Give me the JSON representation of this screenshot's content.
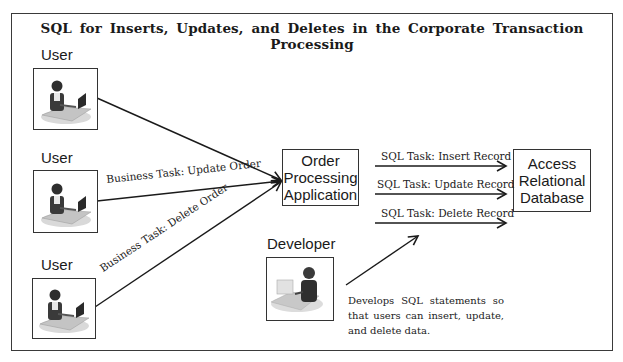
{
  "title": "SQL for Inserts, Updates, and Deletes in the Corporate Transaction Processing",
  "actors": [
    {
      "id": "user-1",
      "label": "User",
      "icon": "user-at-computer-icon"
    },
    {
      "id": "user-2",
      "label": "User",
      "icon": "user-at-computer-icon"
    },
    {
      "id": "user-3",
      "label": "User",
      "icon": "user-at-computer-icon"
    },
    {
      "id": "developer",
      "label": "Developer",
      "icon": "developer-at-computer-icon"
    }
  ],
  "nodes": {
    "app": {
      "lines": [
        "Order",
        "Processing",
        "Application"
      ]
    },
    "db": {
      "lines": [
        "Access",
        "Relational",
        "Database"
      ]
    }
  },
  "edges": {
    "user1_to_app": {
      "label": ""
    },
    "user2_to_app": {
      "label": "Business Task: Update Order"
    },
    "user3_to_app": {
      "label": "Business Task: Delete Order"
    },
    "app_to_db": [
      {
        "label": "SQL Task: Insert Record"
      },
      {
        "label": "SQL Task: Update Record"
      },
      {
        "label": "SQL Task: Delete Record"
      }
    ],
    "developer_to_sql": {
      "label": ""
    }
  },
  "developer_note": "Develops SQL statements so that users can insert, update, and delete data.",
  "colors": {
    "line": "#1a1a1a",
    "border": "#333333",
    "background": "#ffffff"
  }
}
